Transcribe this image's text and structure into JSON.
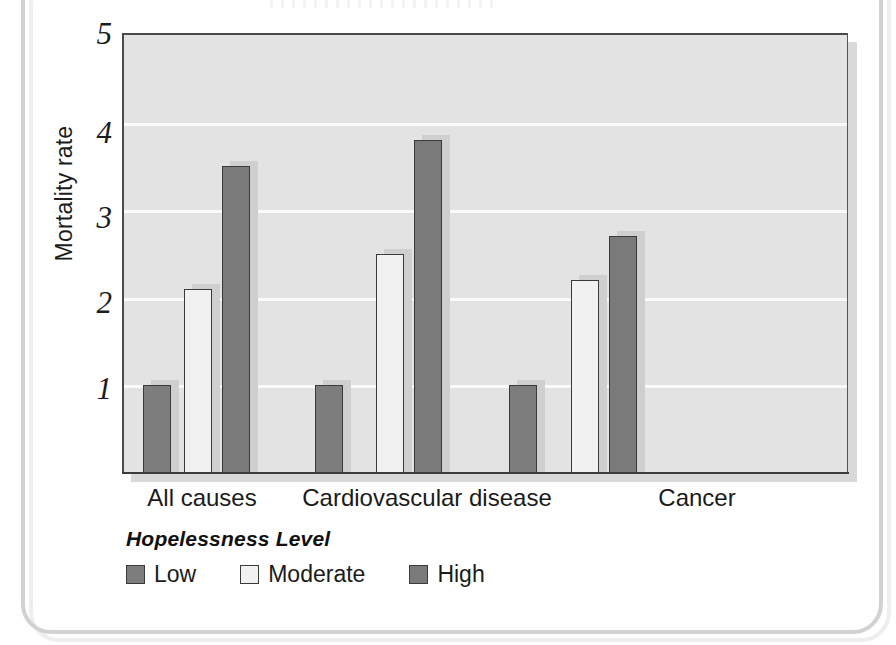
{
  "figure": {
    "frame_color": "#d2d2d2",
    "background": "#ffffff",
    "plot_background": "#e3e3e3",
    "gridline_color": "#fbfbfb"
  },
  "chart_data": {
    "type": "bar",
    "title": "",
    "subtitle": "",
    "xlabel": "",
    "ylabel": "Mortality rate",
    "categories": [
      "All causes",
      "Cardiovascular disease",
      "Cancer"
    ],
    "ylim": [
      0,
      5
    ],
    "yticks": [
      1,
      2,
      3,
      4,
      5
    ],
    "ytick_labels": [
      "1",
      "2",
      "3",
      "4",
      "5"
    ],
    "grid": true,
    "grid_axis": "y",
    "legend_title": "Hopelessness Level",
    "legend_position": "below-left",
    "series": [
      {
        "name": "Low",
        "color": "#7d7d7d",
        "values": [
          1.0,
          1.0,
          1.0
        ]
      },
      {
        "name": "Moderate",
        "color": "#f1f1f1",
        "values": [
          2.1,
          2.5,
          2.2
        ]
      },
      {
        "name": "High",
        "color": "#7a7a7a",
        "values": [
          3.5,
          3.8,
          2.7
        ]
      }
    ]
  },
  "axis": {
    "y_title": "Mortality rate",
    "y_tick_1": "1",
    "y_tick_2": "2",
    "y_tick_3": "3",
    "y_tick_4": "4",
    "y_tick_5": "5",
    "x_cat_0": "All causes",
    "x_cat_1": "Cardiovascular disease",
    "x_cat_2": "Cancer"
  },
  "legend": {
    "title": "Hopelessness Level",
    "items": [
      {
        "label": "Low",
        "color": "#7d7d7d"
      },
      {
        "label": "Moderate",
        "color": "#f1f1f1"
      },
      {
        "label": "High",
        "color": "#7a7a7a"
      }
    ]
  }
}
